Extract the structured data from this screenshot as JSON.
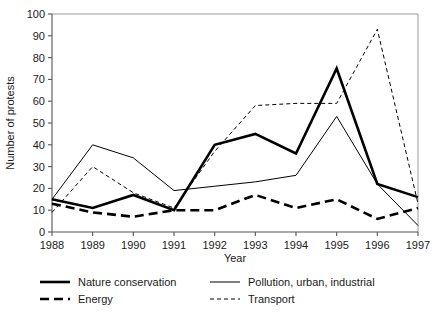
{
  "chart_data": {
    "type": "line",
    "title": "",
    "xlabel": "Year",
    "ylabel": "Number of protests",
    "categories": [
      "1988",
      "1989",
      "1990",
      "1991",
      "1992",
      "1993",
      "1994",
      "1995",
      "1996",
      "1997"
    ],
    "x": [
      1988,
      1989,
      1990,
      1991,
      1992,
      1993,
      1994,
      1995,
      1996,
      1997
    ],
    "xlim": [
      1988,
      1997
    ],
    "ylim": [
      0,
      100
    ],
    "yticks": [
      0,
      10,
      20,
      30,
      40,
      50,
      60,
      70,
      80,
      90,
      100
    ],
    "ytick_labels": [
      "0",
      "10",
      "20",
      "30",
      "40",
      "50",
      "60",
      "70",
      "80",
      "90",
      "100"
    ],
    "grid": false,
    "legend_position": "bottom",
    "series": [
      {
        "name": "Nature conservation",
        "style": "thick-solid",
        "color": "#000000",
        "stroke_width": 2.6,
        "dash": "none",
        "values": [
          15,
          11,
          17,
          10,
          40,
          45,
          36,
          75,
          22,
          16
        ]
      },
      {
        "name": "Energy",
        "style": "thick-dashed",
        "color": "#000000",
        "stroke_width": 2.6,
        "dash": "9,5",
        "values": [
          13,
          9,
          7,
          10,
          10,
          17,
          11,
          15,
          6,
          11
        ]
      },
      {
        "name": "Pollution, urban, industrial",
        "style": "thin-solid",
        "color": "#000000",
        "stroke_width": 1,
        "dash": "none",
        "values": [
          15,
          40,
          34,
          19,
          21,
          23,
          26,
          53,
          22,
          3
        ]
      },
      {
        "name": "Transport",
        "style": "thin-dashed",
        "color": "#000000",
        "stroke_width": 1,
        "dash": "4,3",
        "values": [
          9,
          30,
          18,
          11,
          37,
          58,
          59,
          59,
          93,
          13
        ]
      }
    ]
  },
  "legend": {
    "entries": [
      {
        "label": "Nature conservation"
      },
      {
        "label": "Pollution, urban, industrial"
      },
      {
        "label": "Energy"
      },
      {
        "label": "Transport"
      }
    ]
  },
  "axes": {
    "y_title": "Number of protests",
    "x_title": "Year"
  }
}
